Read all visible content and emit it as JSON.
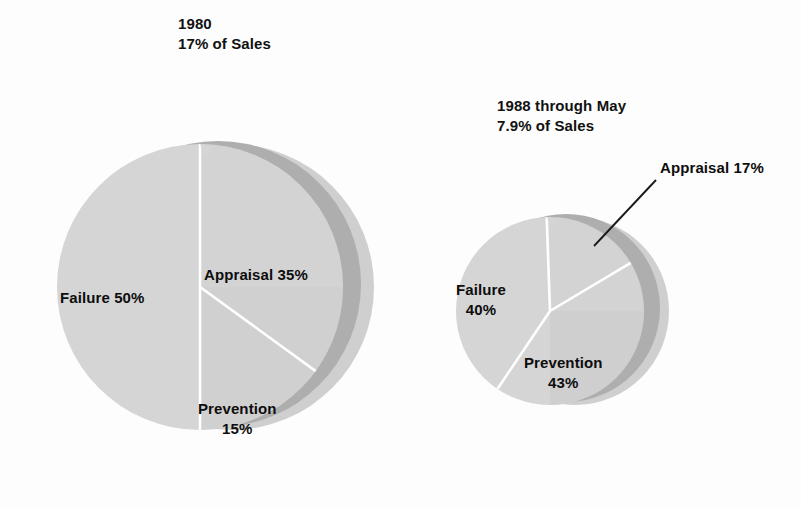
{
  "figure": {
    "background_color": "#fdfdfd",
    "label_color": "#0d0d0d",
    "pie_face_color": "#d5d5d5",
    "pie_ring_dark_color": "#aeaeae",
    "pie_ring_light_color": "#cfcfcf",
    "divider_color": "#ffffff",
    "leader_line_color": "#1a1a1a"
  },
  "titles": {
    "left_line1": "1980",
    "left_line2": "17% of Sales",
    "right_line1": "1988 through May",
    "right_line2": "7.9% of Sales"
  },
  "labels": {
    "left_failure": "Failure 50%",
    "left_appraisal": "Appraisal 35%",
    "left_prevention_line1": "Prevention",
    "left_prevention_line2": "15%",
    "right_failure_line1": "Failure",
    "right_failure_line2": "40%",
    "right_prevention_line1": "Prevention",
    "right_prevention_line2": "43%",
    "right_appraisal": "Appraisal 17%"
  },
  "chart_data": {
    "type": "pie",
    "legend_position": "none",
    "grid": false,
    "charts": [
      {
        "name": "1980",
        "title_line1": "1980",
        "title_line2": "17% of Sales",
        "total_percent_of_sales": 17,
        "relative_size": 1.0,
        "categories": [
          "Failure",
          "Appraisal",
          "Prevention"
        ],
        "values": [
          50,
          35,
          15
        ],
        "labels": [
          "Failure 50%",
          "Appraisal 35%",
          "Prevention 15%"
        ],
        "start_angle_deg_from_12oclock": 0,
        "direction": "clockwise",
        "slice_order_clockwise": [
          "Appraisal",
          "Prevention",
          "Failure"
        ]
      },
      {
        "name": "1988 through May",
        "title_line1": "1988 through May",
        "title_line2": "7.9% of Sales",
        "total_percent_of_sales": 7.9,
        "relative_size": 0.66,
        "categories": [
          "Failure",
          "Prevention",
          "Appraisal"
        ],
        "values": [
          40,
          43,
          17
        ],
        "labels": [
          "Failure 40%",
          "Prevention 43%",
          "Appraisal 17%"
        ],
        "start_angle_deg_from_12oclock": 0,
        "direction": "clockwise",
        "slice_order_clockwise": [
          "Appraisal",
          "Prevention",
          "Failure"
        ]
      }
    ],
    "units": "percent",
    "ylabel": "",
    "xlabel": ""
  }
}
